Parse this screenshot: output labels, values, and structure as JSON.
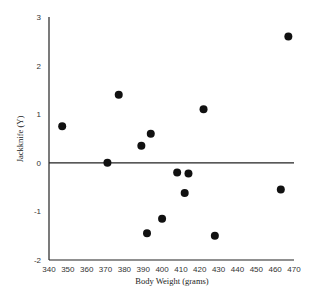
{
  "chart_data": {
    "type": "scatter",
    "title": "",
    "xlabel": "Body Weight (grams)",
    "ylabel": "Jackknife (Y)",
    "xlim": [
      340,
      470
    ],
    "ylim": [
      -2,
      3
    ],
    "xticks": [
      340,
      350,
      360,
      370,
      380,
      390,
      400,
      410,
      420,
      430,
      440,
      450,
      460,
      470
    ],
    "yticks": [
      -2,
      -1,
      0,
      1,
      2,
      3
    ],
    "grid": false,
    "reference_line": {
      "y": 0
    },
    "points": [
      {
        "x": 347,
        "y": 0.75
      },
      {
        "x": 371,
        "y": 0.0
      },
      {
        "x": 377,
        "y": 1.4
      },
      {
        "x": 389,
        "y": 0.35
      },
      {
        "x": 394,
        "y": 0.6
      },
      {
        "x": 392,
        "y": -1.45
      },
      {
        "x": 400,
        "y": -1.15
      },
      {
        "x": 408,
        "y": -0.2
      },
      {
        "x": 414,
        "y": -0.22
      },
      {
        "x": 412,
        "y": -0.62
      },
      {
        "x": 422,
        "y": 1.1
      },
      {
        "x": 428,
        "y": -1.5
      },
      {
        "x": 463,
        "y": -0.55
      },
      {
        "x": 467,
        "y": 2.6
      }
    ]
  }
}
